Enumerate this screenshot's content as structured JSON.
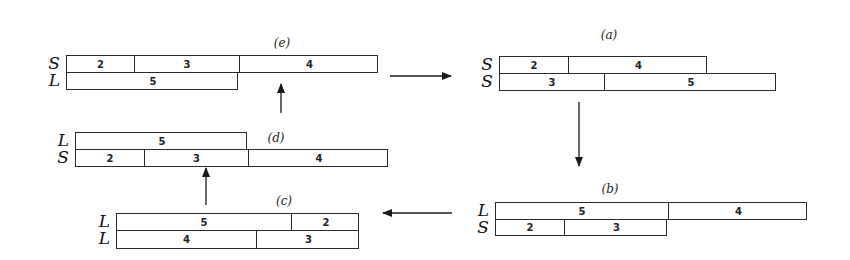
{
  "diagram": {
    "panels": [
      {
        "id": "e",
        "label": "(e)",
        "label_pos": [
          282,
          36
        ],
        "rows": [
          {
            "letter": "S",
            "x": 66,
            "y": 55,
            "h": 17,
            "segments": [
              {
                "value": "2",
                "w": 67
              },
              {
                "value": "3",
                "w": 105
              },
              {
                "value": "4",
                "w": 140
              }
            ]
          },
          {
            "letter": "L",
            "x": 66,
            "y": 72,
            "h": 17,
            "segments": [
              {
                "value": "5",
                "w": 172
              }
            ]
          }
        ]
      },
      {
        "id": "a",
        "label": "(a)",
        "label_pos": [
          609,
          28
        ],
        "rows": [
          {
            "letter": "S",
            "x": 499,
            "y": 56,
            "h": 17,
            "segments": [
              {
                "value": "2",
                "w": 68
              },
              {
                "value": "4",
                "w": 140
              }
            ]
          },
          {
            "letter": "S",
            "x": 499,
            "y": 73,
            "h": 17,
            "segments": [
              {
                "value": "3",
                "w": 104
              },
              {
                "value": "5",
                "w": 173
              }
            ]
          }
        ]
      },
      {
        "id": "b",
        "label": "(b)",
        "label_pos": [
          610,
          182
        ],
        "rows": [
          {
            "letter": "L",
            "x": 495,
            "y": 202,
            "h": 17,
            "segments": [
              {
                "value": "5",
                "w": 172
              },
              {
                "value": "4",
                "w": 140
              }
            ]
          },
          {
            "letter": "S",
            "x": 495,
            "y": 219,
            "h": 16,
            "segments": [
              {
                "value": "2",
                "w": 68
              },
              {
                "value": "3",
                "w": 104
              }
            ]
          }
        ]
      },
      {
        "id": "c",
        "label": "(c)",
        "label_pos": [
          284,
          194
        ],
        "rows": [
          {
            "letter": "L",
            "x": 116,
            "y": 213,
            "h": 17,
            "segments": [
              {
                "value": "5",
                "w": 174
              },
              {
                "value": "2",
                "w": 69
              }
            ]
          },
          {
            "letter": "L",
            "x": 116,
            "y": 230,
            "h": 18,
            "segments": [
              {
                "value": "4",
                "w": 139
              },
              {
                "value": "3",
                "w": 104
              }
            ]
          }
        ]
      },
      {
        "id": "d",
        "label": "(d)",
        "label_pos": [
          276,
          131
        ],
        "rows": [
          {
            "letter": "L",
            "x": 75,
            "y": 132,
            "h": 17,
            "segments": [
              {
                "value": "5",
                "w": 172
              }
            ]
          },
          {
            "letter": "S",
            "x": 75,
            "y": 149,
            "h": 17,
            "segments": [
              {
                "value": "2",
                "w": 68
              },
              {
                "value": "3",
                "w": 104
              },
              {
                "value": "4",
                "w": 141
              }
            ]
          }
        ]
      }
    ],
    "arrows": [
      {
        "from": "e",
        "to": "a",
        "x1": 390,
        "y1": 76,
        "x2": 451,
        "y2": 76
      },
      {
        "from": "a",
        "to": "b",
        "x1": 579,
        "y1": 102,
        "x2": 579,
        "y2": 166
      },
      {
        "from": "b",
        "to": "c",
        "x1": 452,
        "y1": 213,
        "x2": 383,
        "y2": 213
      },
      {
        "from": "c",
        "to": "d",
        "x1": 206,
        "y1": 205,
        "x2": 206,
        "y2": 168
      },
      {
        "from": "d",
        "to": "e",
        "x1": 281,
        "y1": 113,
        "x2": 281,
        "y2": 84
      }
    ],
    "colors": {
      "stroke": "#2a2a2a",
      "text": "#222222",
      "background": "#ffffff"
    }
  }
}
